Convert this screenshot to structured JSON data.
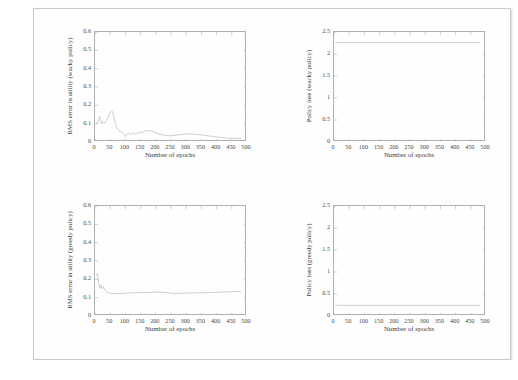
{
  "document": {
    "caption": "Figure 25.11    Exponentiated RMS error in utility and policy loss, model-based"
  },
  "figure": {
    "shared": {
      "xlabel": "Number of epochs",
      "xticks": [
        "0",
        "50",
        "100",
        "150",
        "200",
        "250",
        "300",
        "350",
        "400",
        "450",
        "500"
      ]
    },
    "panels": [
      {
        "id": "top-left",
        "ylabel": "RMS error in utility (wacky policy)",
        "xlabel": "Number of epochs",
        "yticks": [
          "0",
          "0.1",
          "0.2",
          "0.3",
          "0.4",
          "0.5",
          "0.6"
        ]
      },
      {
        "id": "top-right",
        "ylabel": "Policy loss (wacky policy)",
        "xlabel": "Number of epochs",
        "yticks": [
          "0",
          "0.5",
          "1",
          "1.5",
          "2",
          "2.5"
        ]
      },
      {
        "id": "bottom-left",
        "ylabel": "RMS error in utility (greedy policy)",
        "xlabel": "Number of epochs",
        "yticks": [
          "0",
          "0.1",
          "0.2",
          "0.3",
          "0.4",
          "0.5",
          "0.6"
        ]
      },
      {
        "id": "bottom-right",
        "ylabel": "Policy loss (greedy policy)",
        "xlabel": "Number of epochs",
        "yticks": [
          "0",
          "0.5",
          "1",
          "1.5",
          "2",
          "2.5"
        ]
      }
    ]
  },
  "chart_data": [
    {
      "type": "line",
      "title": "",
      "panel": "top-left",
      "xlabel": "Number of epochs",
      "ylabel": "RMS error in utility (wacky policy)",
      "xlim": [
        0,
        500
      ],
      "ylim": [
        0,
        0.6
      ],
      "xticks": [
        0,
        50,
        100,
        150,
        200,
        250,
        300,
        350,
        400,
        450,
        500
      ],
      "yticks": [
        0,
        0.1,
        0.2,
        0.3,
        0.4,
        0.5,
        0.6
      ],
      "grid": false,
      "legend": null,
      "line_color": "#c8c8c8",
      "series": [
        {
          "name": "RMS error (wacky policy)",
          "x": [
            5,
            10,
            15,
            18,
            22,
            27,
            32,
            38,
            44,
            50,
            55,
            58,
            62,
            66,
            70,
            75,
            80,
            85,
            90,
            95,
            100,
            105,
            110,
            115,
            120,
            125,
            130,
            135,
            140,
            145,
            150,
            155,
            160,
            165,
            170,
            175,
            180,
            185,
            190,
            195,
            200,
            210,
            220,
            230,
            240,
            250,
            260,
            270,
            280,
            290,
            300,
            310,
            320,
            330,
            340,
            350,
            360,
            370,
            380,
            390,
            400,
            410,
            420,
            430,
            440,
            450,
            460,
            470,
            480
          ],
          "y": [
            0.103,
            0.108,
            0.14,
            0.123,
            0.098,
            0.112,
            0.103,
            0.118,
            0.14,
            0.16,
            0.17,
            0.166,
            0.14,
            0.112,
            0.084,
            0.07,
            0.062,
            0.058,
            0.052,
            0.042,
            0.03,
            0.04,
            0.048,
            0.044,
            0.04,
            0.05,
            0.046,
            0.042,
            0.05,
            0.054,
            0.05,
            0.054,
            0.058,
            0.06,
            0.062,
            0.062,
            0.062,
            0.06,
            0.058,
            0.054,
            0.05,
            0.044,
            0.04,
            0.036,
            0.034,
            0.034,
            0.036,
            0.038,
            0.04,
            0.042,
            0.044,
            0.044,
            0.044,
            0.042,
            0.04,
            0.038,
            0.036,
            0.034,
            0.032,
            0.03,
            0.028,
            0.026,
            0.024,
            0.022,
            0.02,
            0.02,
            0.02,
            0.02,
            0.02
          ]
        }
      ]
    },
    {
      "type": "line",
      "title": "",
      "panel": "top-right",
      "xlabel": "Number of epochs",
      "ylabel": "Policy loss (wacky policy)",
      "xlim": [
        0,
        500
      ],
      "ylim": [
        0,
        2.5
      ],
      "xticks": [
        0,
        50,
        100,
        150,
        200,
        250,
        300,
        350,
        400,
        450,
        500
      ],
      "yticks": [
        0,
        0.5,
        1,
        1.5,
        2,
        2.5
      ],
      "grid": false,
      "legend": null,
      "line_color": "#c8c8c8",
      "series": [
        {
          "name": "Policy loss (wacky policy)",
          "x": [
            5,
            50,
            100,
            150,
            200,
            250,
            300,
            350,
            400,
            450,
            480
          ],
          "y": [
            2.26,
            2.26,
            2.26,
            2.26,
            2.26,
            2.26,
            2.26,
            2.26,
            2.26,
            2.26,
            2.26
          ]
        }
      ]
    },
    {
      "type": "line",
      "title": "",
      "panel": "bottom-left",
      "xlabel": "Number of epochs",
      "ylabel": "RMS error in utility (greedy policy)",
      "xlim": [
        0,
        500
      ],
      "ylim": [
        0,
        0.6
      ],
      "xticks": [
        0,
        50,
        100,
        150,
        200,
        250,
        300,
        350,
        400,
        450,
        500
      ],
      "yticks": [
        0,
        0.1,
        0.2,
        0.3,
        0.4,
        0.5,
        0.6
      ],
      "grid": false,
      "legend": null,
      "line_color": "#c8c8c8",
      "series": [
        {
          "name": "RMS error (greedy policy)",
          "x": [
            5,
            8,
            12,
            16,
            20,
            24,
            28,
            32,
            36,
            40,
            45,
            50,
            60,
            70,
            80,
            90,
            100,
            120,
            140,
            160,
            180,
            200,
            220,
            240,
            250,
            260,
            270,
            280,
            300,
            320,
            340,
            360,
            380,
            400,
            420,
            440,
            460,
            480
          ],
          "y": [
            0.222,
            0.232,
            0.175,
            0.152,
            0.168,
            0.148,
            0.16,
            0.142,
            0.136,
            0.13,
            0.126,
            0.124,
            0.122,
            0.122,
            0.122,
            0.123,
            0.124,
            0.126,
            0.127,
            0.128,
            0.129,
            0.13,
            0.13,
            0.128,
            0.124,
            0.122,
            0.123,
            0.124,
            0.125,
            0.126,
            0.126,
            0.127,
            0.128,
            0.129,
            0.131,
            0.132,
            0.133,
            0.133
          ]
        }
      ]
    },
    {
      "type": "line",
      "title": "",
      "panel": "bottom-right",
      "xlabel": "Number of epochs",
      "ylabel": "Policy loss (greedy policy)",
      "xlim": [
        0,
        500
      ],
      "ylim": [
        0,
        2.5
      ],
      "xticks": [
        0,
        50,
        100,
        150,
        200,
        250,
        300,
        350,
        400,
        450,
        500
      ],
      "yticks": [
        0,
        0.5,
        1,
        1.5,
        2,
        2.5
      ],
      "grid": false,
      "legend": null,
      "line_color": "#c8c8c8",
      "series": [
        {
          "name": "Policy loss (greedy policy)",
          "x": [
            5,
            20,
            50,
            100,
            150,
            200,
            250,
            300,
            350,
            400,
            450,
            480
          ],
          "y": [
            0.245,
            0.243,
            0.242,
            0.242,
            0.242,
            0.242,
            0.241,
            0.241,
            0.241,
            0.242,
            0.243,
            0.243
          ]
        }
      ]
    }
  ]
}
